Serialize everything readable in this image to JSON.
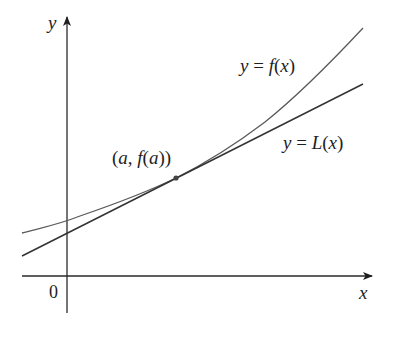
{
  "diagram": {
    "type": "tangent-line-linearization",
    "axes": {
      "x_label": "x",
      "y_label": "y",
      "origin_label": "0"
    },
    "curves": [
      {
        "name": "f",
        "label": "y = f(x)",
        "label_parts": {
          "lhs": "y",
          "eq": " = ",
          "fn": "f",
          "open": "(",
          "arg": "x",
          "close": ")"
        },
        "kind": "convex curve"
      },
      {
        "name": "L",
        "label": "y = L(x)",
        "label_parts": {
          "lhs": "y",
          "eq": " = ",
          "fn": "L",
          "open": "(",
          "arg": "x",
          "close": ")"
        },
        "kind": "tangent line"
      }
    ],
    "point": {
      "label": "(a, f(a))",
      "label_parts": {
        "open": "(",
        "a": "a",
        "comma": ", ",
        "fn": "f",
        "open2": "(",
        "a2": "a",
        "close2": ")",
        "close": ")"
      }
    },
    "colors": {
      "axis": "#2a2a2a",
      "curve_f": "#5a5a5a",
      "line_L": "#333333",
      "point": "#444444",
      "text": "#1e1e1e"
    }
  }
}
